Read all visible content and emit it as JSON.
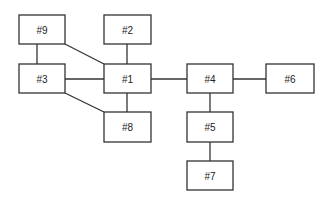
{
  "diagram": {
    "type": "node-graph",
    "nodes": [
      {
        "id": "9",
        "label": "#9",
        "x": 19,
        "y": 15,
        "w": 46,
        "h": 29
      },
      {
        "id": "2",
        "label": "#2",
        "x": 104,
        "y": 15,
        "w": 47,
        "h": 29
      },
      {
        "id": "3",
        "label": "#3",
        "x": 19,
        "y": 64,
        "w": 46,
        "h": 29
      },
      {
        "id": "1",
        "label": "#1",
        "x": 104,
        "y": 64,
        "w": 47,
        "h": 29
      },
      {
        "id": "4",
        "label": "#4",
        "x": 187,
        "y": 64,
        "w": 46,
        "h": 29
      },
      {
        "id": "6",
        "label": "#6",
        "x": 266,
        "y": 64,
        "w": 48,
        "h": 29
      },
      {
        "id": "8",
        "label": "#8",
        "x": 104,
        "y": 112,
        "w": 47,
        "h": 30
      },
      {
        "id": "5",
        "label": "#5",
        "x": 187,
        "y": 112,
        "w": 46,
        "h": 30
      },
      {
        "id": "7",
        "label": "#7",
        "x": 187,
        "y": 161,
        "w": 46,
        "h": 29
      }
    ],
    "edges": [
      {
        "from": "9",
        "to": "3",
        "x1": 37,
        "y1": 44,
        "x2": 37,
        "y2": 64
      },
      {
        "from": "9",
        "to": "1",
        "x1": 65,
        "y1": 44,
        "x2": 104,
        "y2": 64
      },
      {
        "from": "2",
        "to": "1",
        "x1": 127,
        "y1": 44,
        "x2": 127,
        "y2": 64
      },
      {
        "from": "3",
        "to": "1",
        "x1": 65,
        "y1": 79,
        "x2": 104,
        "y2": 79
      },
      {
        "from": "3",
        "to": "8",
        "x1": 65,
        "y1": 93,
        "x2": 104,
        "y2": 112
      },
      {
        "from": "1",
        "to": "8",
        "x1": 127,
        "y1": 93,
        "x2": 127,
        "y2": 112
      },
      {
        "from": "1",
        "to": "4",
        "x1": 151,
        "y1": 79,
        "x2": 187,
        "y2": 79
      },
      {
        "from": "4",
        "to": "6",
        "x1": 233,
        "y1": 79,
        "x2": 266,
        "y2": 79
      },
      {
        "from": "4",
        "to": "5",
        "x1": 210,
        "y1": 93,
        "x2": 210,
        "y2": 112
      },
      {
        "from": "5",
        "to": "7",
        "x1": 210,
        "y1": 142,
        "x2": 210,
        "y2": 161
      }
    ]
  }
}
